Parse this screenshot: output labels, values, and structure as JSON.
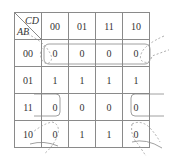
{
  "kmap": {
    "row_var": "AB",
    "col_var": "CD",
    "col_headers": [
      "00",
      "01",
      "11",
      "10"
    ],
    "row_headers": [
      "00",
      "01",
      "11",
      "10"
    ],
    "cells": [
      [
        "0",
        "0",
        "0",
        "0"
      ],
      [
        "1",
        "1",
        "1",
        "1"
      ],
      [
        "0",
        "0",
        "0",
        "0"
      ],
      [
        "0",
        "1",
        "1",
        "0"
      ]
    ],
    "groupings": [
      {
        "type": "solid",
        "description": "row AB=00 all four zeros"
      },
      {
        "type": "solid",
        "description": "row AB=11 wrap-around (cells 00 and 10)"
      },
      {
        "type": "dashed",
        "description": "four corners (AB=00/10, CD=00/10)"
      }
    ],
    "line_color": "#8a8a8a",
    "loop_color": "#888888"
  }
}
